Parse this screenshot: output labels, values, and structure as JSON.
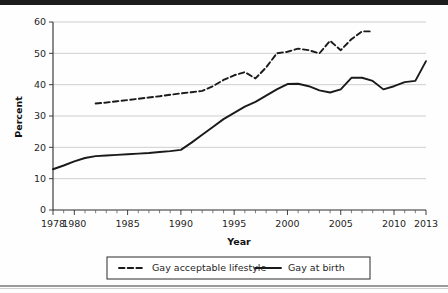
{
  "chart_data": {
    "type": "line",
    "title": "",
    "xlabel": "Year",
    "ylabel": "Percent",
    "xlim": [
      1978,
      2013
    ],
    "ylim": [
      0,
      60
    ],
    "yticks": [
      0,
      10,
      20,
      30,
      40,
      50,
      60
    ],
    "ytick_labels": [
      "0",
      "10",
      "20",
      "30",
      "40",
      "50",
      "60"
    ],
    "xticks": [
      1978,
      1980,
      1985,
      1990,
      1995,
      2000,
      2005,
      2010,
      2013
    ],
    "xtick_labels": [
      "1978",
      "1980",
      "1985",
      "1990",
      "1995",
      "2000",
      "2005",
      "2010",
      "2013"
    ],
    "x_minor_tick_step": 1,
    "grid": "horizontal",
    "legend_position": "below-axes",
    "series": [
      {
        "name": "Gay acceptable lifestyle",
        "style": "dashed",
        "color": "#1a1a1a",
        "x": [
          1982,
          1983,
          1984,
          1985,
          1986,
          1987,
          1988,
          1989,
          1990,
          1991,
          1992,
          1993,
          1994,
          1995,
          1996,
          1997,
          1998,
          1999,
          2000,
          2001,
          2002,
          2003,
          2004,
          2005,
          2006,
          2007,
          2008
        ],
        "values": [
          34,
          34.3,
          34.7,
          35.1,
          35.5,
          35.9,
          36.3,
          36.8,
          37.2,
          37.6,
          38,
          39.5,
          41.5,
          43,
          44,
          42,
          45.5,
          50,
          50.5,
          51.5,
          51,
          50,
          54,
          51,
          54.5,
          57,
          57
        ]
      },
      {
        "name": "Gay at birth",
        "style": "solid",
        "color": "#1a1a1a",
        "x": [
          1978,
          1979,
          1980,
          1981,
          1982,
          1983,
          1984,
          1985,
          1986,
          1987,
          1988,
          1989,
          1990,
          1991,
          1992,
          1993,
          1994,
          1995,
          1996,
          1997,
          1998,
          1999,
          2000,
          2001,
          2002,
          2003,
          2004,
          2005,
          2006,
          2007,
          2008,
          2009,
          2010,
          2011,
          2012,
          2013
        ],
        "values": [
          13,
          14.2,
          15.5,
          16.6,
          17.2,
          17.4,
          17.6,
          17.8,
          18,
          18.2,
          18.5,
          18.8,
          19.2,
          21.5,
          24,
          26.5,
          29,
          31,
          33,
          34.5,
          36.5,
          38.5,
          40.2,
          40.3,
          39.5,
          38.2,
          37.5,
          38.5,
          42.2,
          42.2,
          41.2,
          38.5,
          39.5,
          40.8,
          41.2,
          47.5
        ]
      }
    ]
  },
  "legend": {
    "entries": [
      {
        "label": "Gay acceptable lifestyle",
        "style": "dashed"
      },
      {
        "label": "Gay at birth",
        "style": "solid"
      }
    ]
  },
  "colors": {
    "line": "#1a1a1a",
    "grid": "#c9c9c9",
    "axis": "#2b2b2b",
    "background": "#fefefe"
  }
}
